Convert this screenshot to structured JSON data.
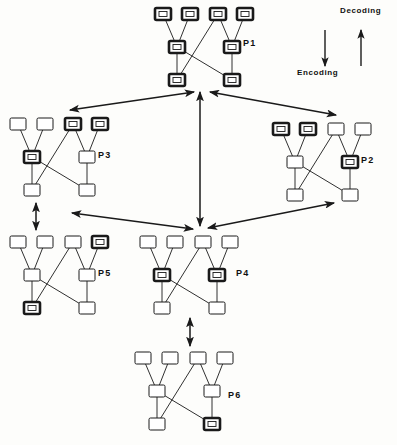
{
  "figure": {
    "width": 397,
    "height": 445,
    "background": "#fdfdfb",
    "stroke_color": "#1a1a1a"
  },
  "legend": {
    "decoding_label": "Decoding",
    "encoding_label": "Encoding",
    "decoding_icon": "arrow-up-icon",
    "encoding_icon": "arrow-down-icon"
  },
  "node_style": {
    "width": 16,
    "height": 12,
    "normal_stroke_width": 1,
    "bold_stroke_width": 2.6,
    "fill": "#ffffff",
    "stroke": "#1a1a1a"
  },
  "tree_topology": {
    "description": "Each cluster has 4 top nodes (t0-t3), 2 middle nodes (m0,m1), 2 bottom nodes (b0,b1)",
    "edges": [
      [
        "t0",
        "m0"
      ],
      [
        "t1",
        "m0"
      ],
      [
        "t2",
        "m1"
      ],
      [
        "t3",
        "m1"
      ],
      [
        "t2",
        "b0"
      ],
      [
        "m0",
        "b0"
      ],
      [
        "m0",
        "b1"
      ],
      [
        "m1",
        "b1"
      ]
    ]
  },
  "clusters": [
    {
      "id": "P1",
      "label": "P1",
      "origin_x": 155,
      "origin_y": 8,
      "label_x": 243,
      "label_y": 38,
      "bold_nodes": [
        "t0",
        "t1",
        "t2",
        "t3",
        "m0",
        "m1",
        "b0",
        "b1"
      ],
      "state": "fully-decoded"
    },
    {
      "id": "P3",
      "label": "P3",
      "origin_x": 10,
      "origin_y": 118,
      "label_x": 98,
      "label_y": 150,
      "bold_nodes": [
        "t2",
        "t3",
        "m0"
      ],
      "state": "partially-decoded"
    },
    {
      "id": "P2",
      "label": "P2",
      "origin_x": 273,
      "origin_y": 123,
      "label_x": 361,
      "label_y": 155,
      "bold_nodes": [
        "t0",
        "t1",
        "m1"
      ],
      "state": "partially-decoded"
    },
    {
      "id": "P5",
      "label": "P5",
      "origin_x": 10,
      "origin_y": 236,
      "label_x": 98,
      "label_y": 268,
      "bold_nodes": [
        "t3",
        "b0"
      ],
      "state": "partially-decoded"
    },
    {
      "id": "P4",
      "label": "P4",
      "origin_x": 140,
      "origin_y": 236,
      "label_x": 236,
      "label_y": 268,
      "bold_nodes": [
        "m0",
        "m1"
      ],
      "state": "partially-decoded"
    },
    {
      "id": "P6",
      "label": "P6",
      "origin_x": 135,
      "origin_y": 352,
      "label_x": 228,
      "label_y": 390,
      "bold_nodes": [
        "b1"
      ],
      "state": "partially-decoded"
    }
  ],
  "connectors": [
    {
      "name": "p1-p3-connector",
      "from": "P1",
      "to": "P3",
      "type": "double-arrow",
      "x1": 194,
      "y1": 92,
      "x2": 70,
      "y2": 110
    },
    {
      "name": "p1-p2-connector",
      "from": "P1",
      "to": "P2",
      "type": "double-arrow",
      "x1": 210,
      "y1": 92,
      "x2": 336,
      "y2": 115
    },
    {
      "name": "p1-p4-connector",
      "from": "P1",
      "to": "P4",
      "type": "double-arrow",
      "x1": 200,
      "y1": 92,
      "x2": 200,
      "y2": 226
    },
    {
      "name": "p3-p4-connector",
      "from": "P3",
      "to": "P4",
      "type": "double-arrow",
      "x1": 72,
      "y1": 213,
      "x2": 193,
      "y2": 229
    },
    {
      "name": "p2-p4-connector",
      "from": "P2",
      "to": "P4",
      "type": "double-arrow",
      "x1": 334,
      "y1": 203,
      "x2": 208,
      "y2": 228
    },
    {
      "name": "p3-p5-connector",
      "from": "P3",
      "to": "P5",
      "type": "double-arrow",
      "x1": 36,
      "y1": 203,
      "x2": 36,
      "y2": 230
    },
    {
      "name": "p4-p6-connector",
      "from": "P4",
      "to": "P6",
      "type": "double-arrow",
      "x1": 190,
      "y1": 318,
      "x2": 190,
      "y2": 346
    }
  ]
}
